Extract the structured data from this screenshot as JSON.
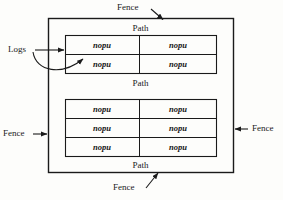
{
  "diagram": {
    "type": "fenced-garden-bed-layout",
    "outer_boundary": {
      "name": "Fence",
      "labels": [
        {
          "id": "fence-top",
          "text": "Fence",
          "position": "top"
        },
        {
          "id": "fence-left",
          "text": "Fence",
          "position": "left"
        },
        {
          "id": "fence-right",
          "text": "Fence",
          "position": "right"
        },
        {
          "id": "fence-bottom",
          "text": "Fence",
          "position": "bottom"
        }
      ]
    },
    "annotations": [
      {
        "id": "logs-label",
        "text": "Logs",
        "position": "left",
        "arrows": 2
      }
    ],
    "paths": [
      {
        "id": "path-top",
        "text": "Path"
      },
      {
        "id": "path-middle",
        "text": "Path"
      },
      {
        "id": "path-bottom",
        "text": "Path"
      }
    ],
    "beds": [
      {
        "id": "bed-upper",
        "rows": 2,
        "columns": 2,
        "cells": [
          [
            "nopu",
            "nopu"
          ],
          [
            "nopu",
            "nopu"
          ]
        ]
      },
      {
        "id": "bed-lower",
        "rows": 3,
        "columns": 2,
        "cells": [
          [
            "nopu",
            "nopu"
          ],
          [
            "nopu",
            "nopu"
          ],
          [
            "nopu",
            "nopu"
          ]
        ]
      }
    ],
    "colors": {
      "background": "#fdfdfb",
      "stroke": "#1a1a1a",
      "text": "#1a1a1a"
    }
  }
}
